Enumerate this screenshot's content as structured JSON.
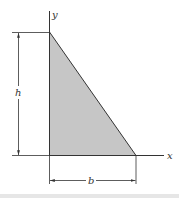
{
  "diagram": {
    "type": "right-triangle-area",
    "axes": {
      "x_label": "x",
      "y_label": "y"
    },
    "dimensions": {
      "height_label": "h",
      "base_label": "b"
    },
    "colors": {
      "fill": "#c6c6c6",
      "stroke": "#333333",
      "background": "#ffffff",
      "band": "#e6e6e6"
    }
  }
}
